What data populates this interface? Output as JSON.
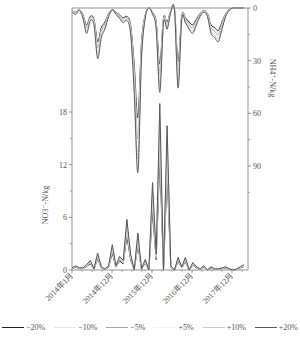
{
  "chart_data": {
    "type": "line",
    "title": "",
    "x_ticks": [
      "2014年1月",
      "2014年12月",
      "2015年12月",
      "2016年12月",
      "2017年12月"
    ],
    "left_axis": {
      "label": "NO3⁻-N/kg",
      "ticks": [
        0,
        6,
        12,
        18
      ],
      "range": [
        0,
        30
      ]
    },
    "right_axis": {
      "label": "NH4⁺-N/kg",
      "ticks": [
        0,
        30,
        60,
        90
      ],
      "range": [
        0,
        150
      ],
      "inverted": true
    },
    "legend": [
      "−20%",
      "−10%",
      "−5%",
      "+5%",
      "+10%",
      "+20%"
    ],
    "legend_colors": [
      "#222222",
      "#e6e6e6",
      "#aaaaaa",
      "#f2f2f2",
      "#cccccc",
      "#555555"
    ],
    "series": [
      {
        "name": "NH4+-N (top, inverted)",
        "x_months": [
          0,
          1,
          2,
          3,
          4,
          5,
          6,
          7,
          8,
          9,
          10,
          11,
          12,
          13,
          14,
          15,
          16,
          17,
          18,
          19,
          20,
          21,
          22,
          23,
          24,
          25,
          26,
          27,
          28,
          29,
          30,
          31,
          32,
          33,
          34,
          35,
          36,
          37,
          38,
          39,
          40,
          41,
          42,
          43,
          44,
          45,
          46,
          47
        ],
        "values": [
          2,
          3,
          1,
          5,
          12,
          6,
          8,
          24,
          14,
          10,
          4,
          1,
          3,
          5,
          7,
          6,
          12,
          40,
          78,
          24,
          5,
          0,
          3,
          10,
          40,
          7,
          10,
          2,
          1,
          38,
          5,
          7,
          10,
          12,
          8,
          4,
          2,
          4,
          12,
          14,
          16,
          10,
          4,
          1,
          0,
          0,
          0,
          0
        ]
      },
      {
        "name": "NO3--N (bottom)",
        "x_months": [
          0,
          1,
          2,
          3,
          4,
          5,
          6,
          7,
          8,
          9,
          10,
          11,
          12,
          13,
          14,
          15,
          16,
          17,
          18,
          19,
          20,
          21,
          22,
          23,
          24,
          25,
          26,
          27,
          28,
          29,
          30,
          31,
          32,
          33,
          34,
          35,
          36,
          37,
          38,
          39,
          40,
          41,
          42,
          43,
          44,
          45,
          46,
          47
        ],
        "values": [
          0.2,
          0.4,
          0.2,
          0.2,
          0.5,
          0.9,
          0.1,
          1.6,
          0.3,
          0.1,
          0.4,
          2.4,
          0.4,
          1.3,
          0.9,
          4.8,
          1.5,
          0,
          3.5,
          0.1,
          1.0,
          0,
          8.3,
          1.5,
          15.8,
          0,
          13.7,
          0.4,
          0,
          1.2,
          0.3,
          1.2,
          0,
          0.7,
          0.3,
          0.1,
          0.4,
          0,
          0.3,
          0.1,
          0.1,
          0.2,
          0.3,
          0.1,
          0,
          0.1,
          0.3,
          0.5
        ]
      }
    ],
    "grid": false,
    "legend_position": "bottom"
  }
}
